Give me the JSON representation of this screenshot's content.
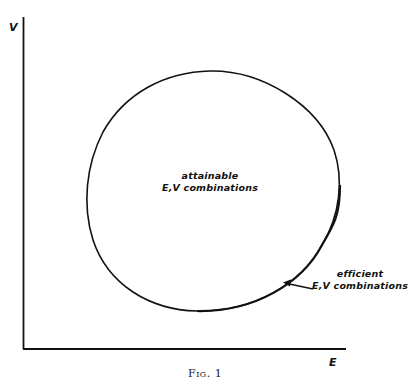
{
  "figure": {
    "caption": "Fig. 1",
    "axes": {
      "y_label": "V",
      "x_label": "E"
    },
    "regions": {
      "attainable": {
        "line1": "attainable",
        "line2": "E,V combinations"
      },
      "efficient": {
        "line1": "efficient",
        "line2": "E,V combinations"
      }
    },
    "colors": {
      "ink": "#111111",
      "background": "#ffffff"
    }
  }
}
